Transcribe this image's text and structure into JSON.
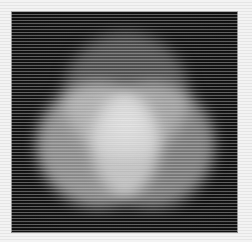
{
  "figure": {
    "title": "Additive colour mixing of three overlapping light circles",
    "caption": "",
    "medium": "grayscale photograph",
    "render_type": "additive-light-overlap"
  },
  "canvas": {
    "width": 252,
    "height": 242,
    "background_color": "#f3f3f3",
    "texture": "horizontal-scanlines"
  },
  "plate": {
    "name": "dark-projection-surface",
    "x": 12,
    "y": 12,
    "width": 225,
    "height": 220,
    "background_color": "#111111",
    "border_color": "#3c3c3c"
  },
  "chart_data": {
    "type": "scatter",
    "title": "Additive colour mixing of three overlapping light circles",
    "xlabel": "",
    "ylabel": "",
    "xlim": [
      12,
      237
    ],
    "ylim": [
      12,
      232
    ],
    "grid": false,
    "legend_position": "none",
    "background": "#111111",
    "series": [
      {
        "name": "top-circle",
        "role": "blue-channel-light",
        "cx": 126,
        "cy": 95,
        "r": 63,
        "gray_level": "#4d4d4d",
        "luminance_percent": 30
      },
      {
        "name": "left-circle",
        "role": "green-channel-light",
        "cx": 98,
        "cy": 145,
        "r": 62,
        "gray_level": "#8c8c8c",
        "luminance_percent": 55
      },
      {
        "name": "right-circle",
        "role": "red-channel-light",
        "cx": 153,
        "cy": 145,
        "r": 62,
        "gray_level": "#7a7a7a",
        "luminance_percent": 48
      }
    ],
    "overlap_regions": [
      {
        "name": "top-left-overlap",
        "gray_level": "#bdbdbd",
        "luminance_percent": 74
      },
      {
        "name": "top-right-overlap",
        "gray_level": "#b0b0b0",
        "luminance_percent": 69
      },
      {
        "name": "left-right-overlap",
        "gray_level": "#e0e0e0",
        "luminance_percent": 88
      },
      {
        "name": "triple-overlap-center",
        "gray_level": "#fbfbfb",
        "luminance_percent": 98,
        "cx": 126,
        "cy": 128
      }
    ]
  },
  "circles": [
    {
      "id": "top",
      "label": "top light circle",
      "cx": 126,
      "cy": 95,
      "r": 63,
      "color": "#4d4d4d"
    },
    {
      "id": "left",
      "label": "left light circle",
      "cx": 98,
      "cy": 145,
      "r": 62,
      "color": "#8c8c8c"
    },
    {
      "id": "right",
      "label": "right light circle",
      "cx": 153,
      "cy": 145,
      "r": 62,
      "color": "#7a7a7a"
    }
  ],
  "hotspot": {
    "id": "center",
    "label": "triple overlap white core",
    "cx": 126,
    "cy": 126,
    "r": 26,
    "color": "#9a9a9a"
  }
}
